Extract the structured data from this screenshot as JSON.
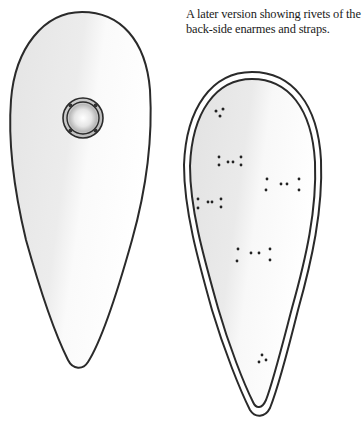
{
  "caption": {
    "line1": "A later version showing rivets of the",
    "line2": "back-side enarmes and straps."
  },
  "figures": [
    {
      "name": "front-shield",
      "description": "Kite shield, front view with central boss",
      "fill_light": "#ffffff",
      "fill_shade": "#e8e8e8",
      "outline": "#2a2a2a",
      "boss": {
        "cx": 83,
        "cy": 118,
        "outer_r": 20,
        "inner_r": 16,
        "dome_r": 13,
        "rivets": 4
      }
    },
    {
      "name": "back-shield",
      "description": "Later kite shield, back view with double rim and rivet groups",
      "fill_light": "#ffffff",
      "fill_shade": "#e6e6e6",
      "outline": "#2a2a2a",
      "rivet_groups": [
        {
          "id": "top",
          "points": [
            [
              216,
              111
            ],
            [
              223,
              109
            ],
            [
              220,
              116
            ]
          ]
        },
        {
          "id": "upper-left",
          "points": [
            [
              219,
              157
            ],
            [
              219,
              165
            ],
            [
              228,
              162
            ],
            [
              233,
              162
            ],
            [
              241,
              157
            ],
            [
              241,
              165
            ]
          ]
        },
        {
          "id": "upper-right",
          "points": [
            [
              267,
              179
            ],
            [
              266,
              190
            ],
            [
              281,
              184
            ],
            [
              287,
              184
            ],
            [
              299,
              179
            ],
            [
              299,
              190
            ]
          ]
        },
        {
          "id": "middle-left",
          "points": [
            [
              198,
              199
            ],
            [
              198,
              208
            ],
            [
              208,
              202
            ],
            [
              212,
              202
            ],
            [
              221,
              199
            ],
            [
              221,
              207
            ]
          ]
        },
        {
          "id": "center",
          "points": [
            [
              238,
              249
            ],
            [
              237,
              261
            ],
            [
              251,
              253
            ],
            [
              259,
              253
            ],
            [
              270,
              249
            ],
            [
              270,
              260
            ]
          ]
        },
        {
          "id": "bottom",
          "points": [
            [
              262,
              355
            ],
            [
              259,
              362
            ],
            [
              266,
              360
            ]
          ]
        }
      ]
    }
  ],
  "colors": {
    "ink": "#2a2a2a",
    "shade": "#e6e6e6",
    "paper": "#ffffff",
    "text": "#1a1a1a"
  }
}
